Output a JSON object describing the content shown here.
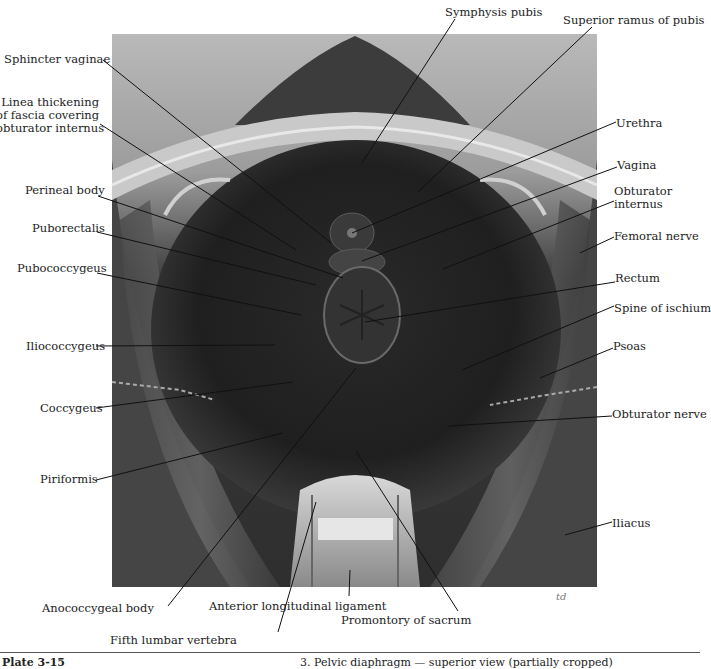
{
  "figure": {
    "image_box": {
      "x": 112,
      "y": 34,
      "w": 485,
      "h": 553
    },
    "signature": "td",
    "labels_left": [
      {
        "id": "sphincter-vaginae",
        "text": "Sphincter vaginae",
        "x": 4,
        "y": 53,
        "w": 98,
        "lx1": 103,
        "ly1": 60,
        "lx2": 331,
        "ly2": 243
      },
      {
        "id": "linea-thickening",
        "text": "Linea thickening\nof fascia covering\nobturator internus",
        "x": -4,
        "y": 96,
        "w": 103,
        "lx1": 100,
        "ly1": 124,
        "lx2": 296,
        "ly2": 250
      },
      {
        "id": "perineal-body",
        "text": "Perineal body",
        "x": 25,
        "y": 184,
        "w": 73,
        "lx1": 98,
        "ly1": 196,
        "lx2": 343,
        "ly2": 278
      },
      {
        "id": "puborectalis",
        "text": "Puborectalis",
        "x": 32,
        "y": 222,
        "w": 65,
        "lx1": 97,
        "ly1": 232,
        "lx2": 316,
        "ly2": 285
      },
      {
        "id": "pubococcygeus",
        "text": "Pubococcygeus",
        "x": 17,
        "y": 262,
        "w": 80,
        "lx1": 97,
        "ly1": 273,
        "lx2": 301,
        "ly2": 315
      },
      {
        "id": "iliococcygeus",
        "text": "Iliococcygeus",
        "x": 26,
        "y": 340,
        "w": 70,
        "lx1": 96,
        "ly1": 346,
        "lx2": 275,
        "ly2": 345
      },
      {
        "id": "coccygeus",
        "text": "Coccygeus",
        "x": 40,
        "y": 402,
        "w": 56,
        "lx1": 96,
        "ly1": 408,
        "lx2": 293,
        "ly2": 382
      },
      {
        "id": "piriformis",
        "text": "Piriformis",
        "x": 40,
        "y": 473,
        "w": 56,
        "lx1": 96,
        "ly1": 480,
        "lx2": 283,
        "ly2": 433
      }
    ],
    "labels_right": [
      {
        "id": "symphysis-pubis",
        "text": "Symphysis pubis",
        "x": 445,
        "y": 6,
        "lx1": 455,
        "ly1": 19,
        "lx2": 362,
        "ly2": 163
      },
      {
        "id": "superior-ramus-pubis",
        "text": "Superior ramus of pubis",
        "x": 563,
        "y": 14,
        "lx1": 592,
        "ly1": 27,
        "lx2": 418,
        "ly2": 192
      },
      {
        "id": "urethra",
        "text": "Urethra",
        "x": 616,
        "y": 117,
        "lx1": 616,
        "ly1": 122,
        "lx2": 352,
        "ly2": 233
      },
      {
        "id": "vagina",
        "text": "Vagina",
        "x": 617,
        "y": 159,
        "lx1": 617,
        "ly1": 167,
        "lx2": 362,
        "ly2": 261
      },
      {
        "id": "obturator-internus",
        "text": "Obturator\ninternus",
        "x": 614,
        "y": 185,
        "lx1": 614,
        "ly1": 201,
        "lx2": 443,
        "ly2": 269
      },
      {
        "id": "femoral-nerve",
        "text": "Femoral nerve",
        "x": 614,
        "y": 230,
        "lx1": 614,
        "ly1": 237,
        "lx2": 580,
        "ly2": 253
      },
      {
        "id": "rectum",
        "text": "Rectum",
        "x": 615,
        "y": 272,
        "lx1": 615,
        "ly1": 282,
        "lx2": 365,
        "ly2": 322
      },
      {
        "id": "spine-of-ischium",
        "text": "Spine of ischium",
        "x": 614,
        "y": 302,
        "lx1": 614,
        "ly1": 306,
        "lx2": 462,
        "ly2": 370
      },
      {
        "id": "psoas",
        "text": "Psoas",
        "x": 613,
        "y": 340,
        "lx1": 613,
        "ly1": 348,
        "lx2": 540,
        "ly2": 378
      },
      {
        "id": "obturator-nerve",
        "text": "Obturator nerve",
        "x": 612,
        "y": 408,
        "lx1": 612,
        "ly1": 416,
        "lx2": 448,
        "ly2": 426
      },
      {
        "id": "iliacus",
        "text": "Iliacus",
        "x": 612,
        "y": 517,
        "lx1": 612,
        "ly1": 522,
        "lx2": 565,
        "ly2": 535
      }
    ],
    "labels_bottom": [
      {
        "id": "anococcygeal-body",
        "text": "Anococcygeal body",
        "x": 42,
        "y": 602,
        "lx1": 168,
        "ly1": 606,
        "lx2": 356,
        "ly2": 368
      },
      {
        "id": "fifth-lumbar-vertebra",
        "text": "Fifth lumbar vertebra",
        "x": 110,
        "y": 634,
        "lx1": 278,
        "ly1": 632,
        "lx2": 316,
        "ly2": 502
      },
      {
        "id": "anterior-longitudinal-ligament",
        "text": "Anterior longitudinal ligament",
        "x": 209,
        "y": 600,
        "lx1": 349,
        "ly1": 596,
        "lx2": 350,
        "ly2": 570
      },
      {
        "id": "promontory-of-sacrum",
        "text": "Promontory of sacrum",
        "x": 341,
        "y": 614,
        "lx1": 458,
        "ly1": 611,
        "lx2": 356,
        "ly2": 451
      }
    ]
  },
  "caption": {
    "plate": "Plate 3-15",
    "title": "3. Pelvic diaphragm — superior view (partially cropped)"
  }
}
